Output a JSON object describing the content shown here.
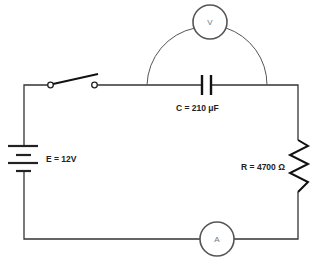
{
  "diagram": {
    "type": "circuit-schematic",
    "colors": {
      "wire": "#333333",
      "meter_outline": "#555555",
      "label": "#222222",
      "background": "#ffffff"
    },
    "components": {
      "battery": {
        "label": "E = 12V",
        "symbol": "battery"
      },
      "switch": {
        "state": "open",
        "symbol": "spst-switch"
      },
      "capacitor": {
        "label": "C = 210 μF",
        "symbol": "capacitor"
      },
      "resistor": {
        "label": "R = 4700 Ω",
        "symbol": "resistor"
      },
      "voltmeter": {
        "label": "V",
        "symbol": "voltmeter",
        "connected": "across capacitor"
      },
      "ammeter": {
        "label": "A",
        "symbol": "ammeter",
        "connected": "in series"
      }
    }
  }
}
